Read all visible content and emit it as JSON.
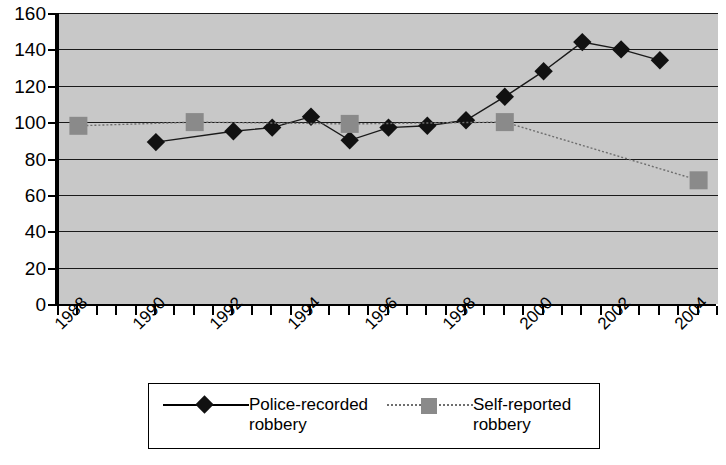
{
  "chart_data": {
    "type": "line",
    "title": "",
    "xlabel": "",
    "ylabel": "",
    "ylim": [
      0,
      160
    ],
    "ytick_step": 20,
    "ytick_labels": [
      "160",
      "140",
      "120",
      "100",
      "80",
      "60",
      "40",
      "20",
      "0"
    ],
    "ytick_values": [
      160,
      140,
      120,
      100,
      80,
      60,
      40,
      20,
      0
    ],
    "xlim": [
      1988,
      2005
    ],
    "xtick_labels": [
      "1988",
      "1990",
      "1992",
      "1994",
      "1996",
      "1998",
      "2000",
      "2002",
      "2004"
    ],
    "xtick_values": [
      1988,
      1990,
      1992,
      1994,
      1996,
      1998,
      2000,
      2002,
      2004
    ],
    "grid": true,
    "legend_position": "bottom",
    "plot_background": "#c8c8c8",
    "series": [
      {
        "name": "Police-recorded robbery",
        "legend_label": "Police-recorded\nrobbery",
        "marker": "diamond",
        "marker_color": "#111111",
        "line_style": "solid",
        "line_color": "#1a1a1a",
        "x": [
          1990.5,
          1992.5,
          1993.5,
          1994.5,
          1995.5,
          1996.5,
          1997.5,
          1998.5,
          1999.5,
          2000.5,
          2001.5,
          2002.5,
          2003.5
        ],
        "values": [
          89,
          95,
          97,
          103,
          90,
          97,
          98,
          101,
          114,
          128,
          144,
          140,
          134
        ]
      },
      {
        "name": "Self-reported robbery",
        "legend_label": "Self-reported\nrobbery",
        "marker": "square",
        "marker_color": "#8a8a8a",
        "line_style": "dotted",
        "line_color": "#6e6e6e",
        "x": [
          1988.5,
          1991.5,
          1995.5,
          1999.5,
          2004.5
        ],
        "values": [
          98,
          100,
          99,
          100,
          68
        ]
      }
    ]
  },
  "legend": {
    "entries": [
      {
        "label": "Police-recorded\nrobbery",
        "marker": "diamond-marker",
        "line": "solid-line"
      },
      {
        "label": "Self-reported\nrobbery",
        "marker": "square-marker",
        "line": "dotted-line"
      }
    ]
  }
}
